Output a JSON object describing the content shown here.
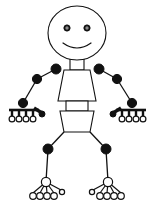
{
  "canvas": {
    "width": 155,
    "height": 211,
    "background": "#ffffff",
    "stroke_color": "#111111",
    "title": "Stick Figure Human Body Diagram"
  },
  "palette": {
    "outline": "#111111",
    "fill_white": "#ffffff",
    "eye_iris": "#8a8a8a",
    "joint_filled": "#111111",
    "joint_open": "#ffffff"
  },
  "figure": {
    "head": {
      "label": "head",
      "shape": "ellipse",
      "cx": 77,
      "cy": 33,
      "rx": 29,
      "ry": 27,
      "stroke_width": 1.1,
      "fill": "#ffffff"
    },
    "eyes": [
      {
        "label": "left-eye",
        "cx": 67,
        "cy": 28,
        "r_outer": 3.1,
        "r_inner": 1.7
      },
      {
        "label": "right-eye",
        "cx": 87,
        "cy": 28,
        "r_outer": 3.1,
        "r_inner": 1.7
      }
    ],
    "mouth": {
      "label": "smile",
      "path": "M 63 43 Q 77 53 91 43",
      "stroke_width": 1.2
    },
    "neck": {
      "label": "neck",
      "x": 70,
      "y": 59,
      "width": 14,
      "height": 11,
      "stroke_width": 1.1
    },
    "chest": {
      "label": "chest-trapezoid",
      "points": "64,70 90,70 96,101 58,101",
      "stroke_width": 1.1
    },
    "waist": {
      "label": "waist",
      "x": 66,
      "y": 101,
      "width": 22,
      "height": 10,
      "stroke_width": 1.1
    },
    "hips": {
      "label": "hips-trapezoid",
      "points": "60,111 94,111 90,132 64,132",
      "stroke_width": 1.1
    },
    "shoulders": [
      {
        "label": "left-shoulder",
        "cx": 56,
        "cy": 69,
        "r": 5.0,
        "fill": "filled"
      },
      {
        "label": "right-shoulder",
        "cx": 99,
        "cy": 69,
        "r": 5.0,
        "fill": "filled"
      }
    ],
    "elbows": [
      {
        "label": "left-elbow",
        "cx": 37,
        "cy": 79,
        "r": 4.6,
        "fill": "filled"
      },
      {
        "label": "right-elbow",
        "cx": 117,
        "cy": 79,
        "r": 4.6,
        "fill": "filled"
      }
    ],
    "wrists": [
      {
        "label": "left-wrist",
        "cx": 23,
        "cy": 103,
        "r": 4.6,
        "fill": "filled"
      },
      {
        "label": "right-wrist",
        "cx": 132,
        "cy": 103,
        "r": 4.6,
        "fill": "filled"
      }
    ],
    "arm_segments": [
      {
        "label": "left-upper-arm",
        "x1": 56,
        "y1": 69,
        "x2": 37,
        "y2": 79,
        "stroke_width": 1.3
      },
      {
        "label": "left-forearm",
        "x1": 37,
        "y1": 79,
        "x2": 23,
        "y2": 103,
        "stroke_width": 1.3
      },
      {
        "label": "right-upper-arm",
        "x1": 99,
        "y1": 69,
        "x2": 117,
        "y2": 79,
        "stroke_width": 1.3
      },
      {
        "label": "right-forearm",
        "x1": 117,
        "y1": 79,
        "x2": 132,
        "y2": 103,
        "stroke_width": 1.3
      }
    ],
    "knees": [
      {
        "label": "left-knee",
        "cx": 48,
        "cy": 149,
        "r": 5.0,
        "fill": "filled"
      },
      {
        "label": "right-knee",
        "cx": 106,
        "cy": 149,
        "r": 5.0,
        "fill": "filled"
      }
    ],
    "ankles": [
      {
        "label": "left-ankle",
        "cx": 46,
        "cy": 182,
        "r": 4.6,
        "fill": "open"
      },
      {
        "label": "right-ankle",
        "cx": 108,
        "cy": 182,
        "r": 4.6,
        "fill": "open"
      }
    ],
    "leg_segments": [
      {
        "label": "left-thigh",
        "x1": 64,
        "y1": 132,
        "x2": 48,
        "y2": 149,
        "stroke_width": 1.3
      },
      {
        "label": "left-shin",
        "x1": 48,
        "y1": 149,
        "x2": 46,
        "y2": 182,
        "stroke_width": 1.3
      },
      {
        "label": "right-thigh",
        "x1": 90,
        "y1": 132,
        "x2": 106,
        "y2": 149,
        "stroke_width": 1.3
      },
      {
        "label": "right-shin",
        "x1": 106,
        "y1": 149,
        "x2": 108,
        "y2": 182,
        "stroke_width": 1.3
      }
    ],
    "hands": [
      {
        "label": "left-hand",
        "side": "left",
        "wrist": {
          "cx": 23,
          "cy": 103
        },
        "palm_bar": {
          "x1": 9,
          "y1": 110,
          "x2": 39,
          "y2": 110,
          "stroke_width": 1.6
        },
        "finger_count": 4,
        "fingers": [
          {
            "label": "finger-1",
            "x": 12,
            "joint_y": 110,
            "tip_y": 118,
            "r": 2.9
          },
          {
            "label": "finger-2",
            "x": 19,
            "joint_y": 110,
            "tip_y": 118,
            "r": 2.9
          },
          {
            "label": "finger-3",
            "x": 26,
            "joint_y": 110,
            "tip_y": 118,
            "r": 2.9
          },
          {
            "label": "finger-4",
            "x": 33,
            "joint_y": 110,
            "tip_y": 118,
            "r": 2.9
          }
        ],
        "thumb": {
          "label": "thumb",
          "x1": 34,
          "y1": 108,
          "x2": 42,
          "y2": 113,
          "r": 3.0,
          "tip_cx": 42,
          "tip_cy": 114
        }
      },
      {
        "label": "right-hand",
        "side": "right",
        "wrist": {
          "cx": 132,
          "cy": 103
        },
        "palm_bar": {
          "x1": 116,
          "y1": 110,
          "x2": 146,
          "y2": 110,
          "stroke_width": 1.6
        },
        "finger_count": 4,
        "fingers": [
          {
            "label": "finger-1",
            "x": 122,
            "joint_y": 110,
            "tip_y": 118,
            "r": 2.9
          },
          {
            "label": "finger-2",
            "x": 129,
            "joint_y": 110,
            "tip_y": 118,
            "r": 2.9
          },
          {
            "label": "finger-3",
            "x": 136,
            "joint_y": 110,
            "tip_y": 118,
            "r": 2.9
          },
          {
            "label": "finger-4",
            "x": 143,
            "joint_y": 110,
            "tip_y": 118,
            "r": 2.9
          }
        ],
        "thumb": {
          "label": "thumb",
          "x1": 121,
          "y1": 108,
          "x2": 113,
          "y2": 113,
          "r": 3.0,
          "tip_cx": 113,
          "tip_cy": 114
        }
      }
    ],
    "feet": [
      {
        "label": "left-foot",
        "side": "left",
        "ankle": {
          "cx": 46,
          "cy": 182
        },
        "toe_count": 5,
        "toes": [
          {
            "label": "toe-1",
            "cx": 33,
            "cy": 196,
            "r": 3.3,
            "open": true
          },
          {
            "label": "toe-2",
            "cx": 40,
            "cy": 196,
            "r": 3.3,
            "open": true
          },
          {
            "label": "toe-3",
            "cx": 47,
            "cy": 196,
            "r": 3.3,
            "open": true
          },
          {
            "label": "toe-4",
            "cx": 54,
            "cy": 196,
            "r": 3.3,
            "open": true
          },
          {
            "label": "toe-5-small",
            "cx": 62,
            "cy": 192,
            "r": 2.6,
            "open": true
          }
        ]
      },
      {
        "label": "right-foot",
        "side": "right",
        "ankle": {
          "cx": 108,
          "cy": 182
        },
        "toe_count": 5,
        "toes": [
          {
            "label": "toe-1",
            "cx": 121,
            "cy": 196,
            "r": 3.3,
            "open": true
          },
          {
            "label": "toe-2",
            "cx": 114,
            "cy": 196,
            "r": 3.3,
            "open": true
          },
          {
            "label": "toe-3",
            "cx": 107,
            "cy": 196,
            "r": 3.3,
            "open": true
          },
          {
            "label": "toe-4",
            "cx": 100,
            "cy": 196,
            "r": 3.3,
            "open": true
          },
          {
            "label": "toe-5-small",
            "cx": 92,
            "cy": 192,
            "r": 2.6,
            "open": true
          }
        ]
      }
    ]
  }
}
